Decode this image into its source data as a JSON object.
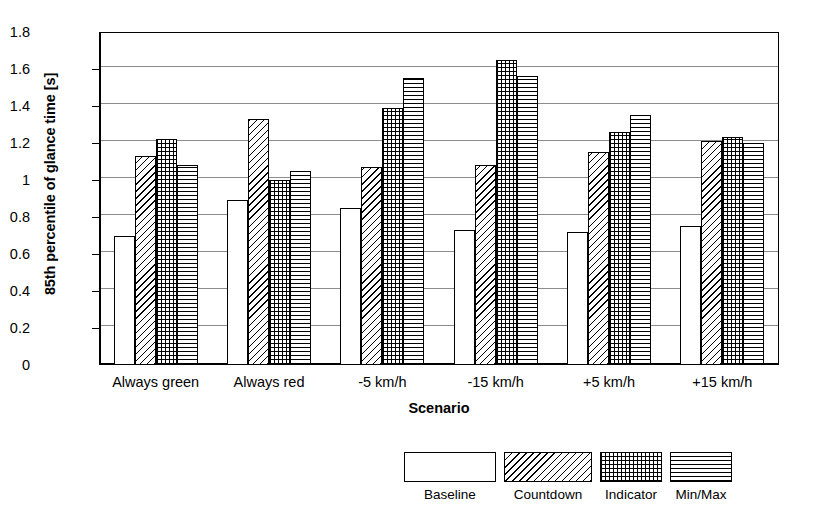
{
  "chart_data": {
    "type": "bar",
    "title": "",
    "xlabel": "Scenario",
    "ylabel": "85th percentile of glance time [s]",
    "ylim": [
      0,
      1.8
    ],
    "ytick_step": 0.2,
    "grid": true,
    "legend_position": "bottom",
    "categories": [
      "Always green",
      "Always red",
      "-5 km/h",
      "-15 km/h",
      "+5 km/h",
      "+15 km/h"
    ],
    "ytick_labels": [
      "0",
      "0.2",
      "0.4",
      "0.6",
      "0.8",
      "1",
      "1.2",
      "1.4",
      "1.6",
      "1.8"
    ],
    "ytick_values": [
      0,
      0.2,
      0.4,
      0.6,
      0.8,
      1.0,
      1.2,
      1.4,
      1.6,
      1.8
    ],
    "series": [
      {
        "name": "Baseline",
        "pattern": "white",
        "values": [
          0.7,
          0.89,
          0.85,
          0.73,
          0.72,
          0.75
        ]
      },
      {
        "name": "Countdown",
        "pattern": "diagonal",
        "values": [
          1.13,
          1.33,
          1.07,
          1.08,
          1.15,
          1.21
        ]
      },
      {
        "name": "Indicator",
        "pattern": "dotted",
        "values": [
          1.22,
          1.0,
          1.39,
          1.65,
          1.26,
          1.23
        ]
      },
      {
        "name": "Min/Max",
        "pattern": "horizontal",
        "values": [
          1.08,
          1.05,
          1.55,
          1.56,
          1.35,
          1.2
        ]
      }
    ]
  },
  "legend": {
    "items": [
      {
        "label": "Baseline"
      },
      {
        "label": "Countdown"
      },
      {
        "label": "Indicator"
      },
      {
        "label": "Min/Max"
      }
    ]
  },
  "colors": {
    "axis": "#000000",
    "grid": "#8c8c8c",
    "background": "#ffffff",
    "bar_outline": "#000000",
    "bar_fill": "#ffffff"
  }
}
